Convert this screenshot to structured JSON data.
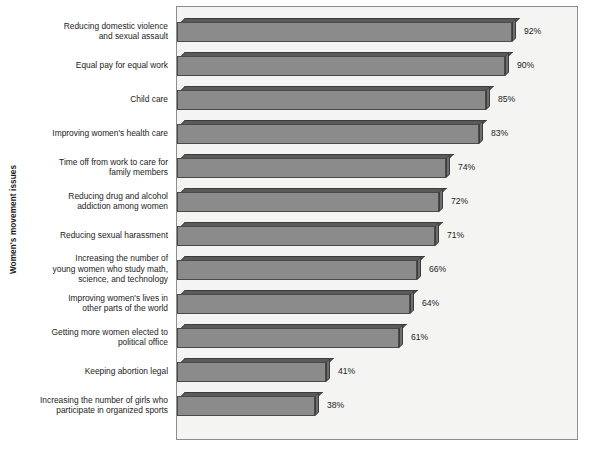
{
  "chart_data": {
    "type": "bar",
    "orientation": "horizontal",
    "title": "",
    "xlabel": "",
    "ylabel": "Women's movement issues",
    "xlim": [
      0,
      100
    ],
    "grid": false,
    "legend": null,
    "value_suffix": "%",
    "categories": [
      "Reducing domestic violence\nand sexual assault",
      "Equal pay for equal work",
      "Child care",
      "Improving women's health care",
      "Time off from work to care for\nfamily members",
      "Reducing drug and alcohol\naddiction among women",
      "Reducing sexual harassment",
      "Increasing the number of\nyoung women who study math,\nscience, and technology",
      "Improving women's lives in\nother parts of the world",
      "Getting more women elected to\npolitical office",
      "Keeping abortion legal",
      "Increasing the number of girls who\nparticipate in organized sports"
    ],
    "values": [
      92,
      90,
      85,
      83,
      74,
      72,
      71,
      66,
      64,
      61,
      41,
      38
    ],
    "value_labels": [
      "92%",
      "90%",
      "85%",
      "83%",
      "74%",
      "72%",
      "71%",
      "66%",
      "64%",
      "61%",
      "41%",
      "38%"
    ],
    "colors": {
      "bar_front": "#8b8b8b",
      "bar_top": "#5a5a5a",
      "bar_side": "#6e6e6e",
      "bar_edge": "#3c3c3c",
      "plot_background": "#f4f4f2",
      "plot_border": "#8d8d8d",
      "text": "#1c1c1c",
      "page_background": "#ffffff"
    }
  }
}
